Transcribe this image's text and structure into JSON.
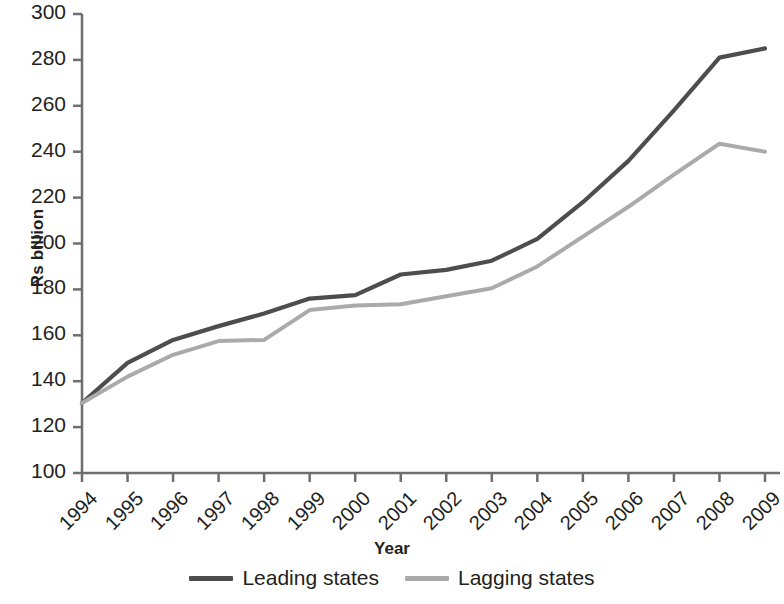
{
  "chart_data": {
    "type": "line",
    "title": "",
    "xlabel": "Year",
    "ylabel": "Rs billion",
    "x": [
      "1994",
      "1995",
      "1996",
      "1997",
      "1998",
      "1999",
      "2000",
      "2001",
      "2002",
      "2003",
      "2004",
      "2005",
      "2006",
      "2007",
      "2008",
      "2009"
    ],
    "categories": [
      "1994",
      "1995",
      "1996",
      "1997",
      "1998",
      "1999",
      "2000",
      "2001",
      "2002",
      "2003",
      "2004",
      "2005",
      "2006",
      "2007",
      "2008",
      "2009"
    ],
    "series": [
      {
        "name": "Leading states",
        "color": "#4d4d4d",
        "values": [
          130.5,
          148,
          158,
          164,
          169.5,
          176,
          177.5,
          186.5,
          188.5,
          192.5,
          202,
          218,
          236,
          258,
          281,
          285
        ]
      },
      {
        "name": "Lagging states",
        "color": "#aaaaaa",
        "values": [
          130.5,
          142,
          151.5,
          157.5,
          158,
          171,
          173,
          173.5,
          177,
          180.5,
          190,
          203,
          216,
          230,
          243.5,
          240
        ]
      }
    ],
    "ylim": [
      100,
      300
    ],
    "yticks": [
      100,
      120,
      140,
      160,
      180,
      200,
      220,
      240,
      260,
      280,
      300
    ],
    "ytick_labels": [
      "100",
      "120",
      "140",
      "160",
      "180",
      "200",
      "220",
      "240",
      "260",
      "280",
      "300"
    ],
    "grid": false,
    "legend_position": "bottom-center",
    "axis_color": "#6e6e6e"
  },
  "legend": {
    "items": [
      {
        "label": "Leading states",
        "color": "#4d4d4d"
      },
      {
        "label": "Lagging states",
        "color": "#aaaaaa"
      }
    ]
  },
  "axes": {
    "y_title": "Rs billion",
    "x_title": "Year"
  }
}
